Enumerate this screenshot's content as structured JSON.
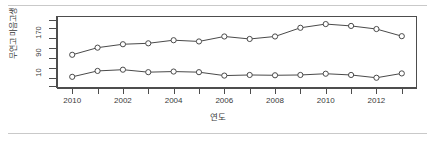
{
  "chart_data": {
    "type": "line",
    "title": "",
    "xlabel": "연도",
    "ylabel": "무연고 마음고생",
    "x": [
      2000,
      2001,
      2002,
      2003,
      2004,
      2005,
      2006,
      2007,
      2008,
      2009,
      2010,
      2011,
      2012,
      2013
    ],
    "xtick_labels": [
      "2010",
      "2002",
      "2004",
      "2006",
      "2008",
      "2010",
      "2012"
    ],
    "xtick_values": [
      2000,
      2002,
      2004,
      2006,
      2008,
      2010,
      2012
    ],
    "ytick_labels": [
      "10",
      "90",
      "170"
    ],
    "ytick_values": [
      10,
      90,
      170
    ],
    "ylim": [
      -14,
      218
    ],
    "xlim": [
      1999.4,
      2013.6
    ],
    "grid": false,
    "legend": "none",
    "series": [
      {
        "name": "상단 계열",
        "marker": "circle-open",
        "values": [
          93,
          116,
          127,
          130,
          140,
          136,
          152,
          144,
          152,
          180,
          192,
          186,
          176,
          153
        ]
      },
      {
        "name": "하단 계열",
        "marker": "circle-open",
        "values": [
          22,
          41,
          45,
          37,
          39,
          37,
          26,
          28,
          27,
          28,
          32,
          28,
          19,
          33
        ]
      }
    ]
  }
}
